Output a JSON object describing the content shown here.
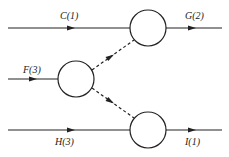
{
  "diagram": {
    "type": "flow-network",
    "nodes": [
      {
        "id": "top",
        "cx": 148,
        "cy": 28,
        "r": 18
      },
      {
        "id": "middle",
        "cx": 76,
        "cy": 79,
        "r": 18
      },
      {
        "id": "bottom",
        "cx": 148,
        "cy": 130,
        "r": 18
      }
    ],
    "edges": [
      {
        "id": "C",
        "label": "C(1)",
        "style": "solid"
      },
      {
        "id": "G",
        "label": "G(2)",
        "style": "solid"
      },
      {
        "id": "F",
        "label": "F(3)",
        "style": "solid"
      },
      {
        "id": "H",
        "label": "H(3)",
        "style": "solid"
      },
      {
        "id": "I",
        "label": "I(1)",
        "style": "solid"
      },
      {
        "id": "middle-to-top",
        "label": "",
        "style": "dashed"
      },
      {
        "id": "middle-to-bottom",
        "label": "",
        "style": "dashed"
      }
    ]
  }
}
